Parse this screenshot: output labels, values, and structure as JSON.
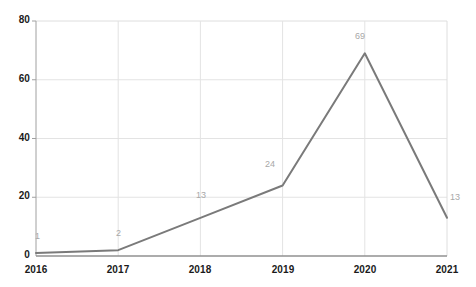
{
  "chart_data": {
    "type": "line",
    "title": "",
    "subtitle": "",
    "xlabel": "",
    "ylabel": "",
    "categories": [
      "2016",
      "2017",
      "2018",
      "2019",
      "2020",
      "2021"
    ],
    "values": [
      1,
      2,
      13,
      24,
      69,
      13
    ],
    "point_labels": [
      "1",
      "2",
      "13",
      "24",
      "69",
      "13"
    ],
    "series": [
      {
        "name": "",
        "values": [
          1,
          2,
          13,
          24,
          69,
          13
        ]
      }
    ],
    "ylim": [
      0,
      80
    ],
    "yticks": [
      0,
      20,
      40,
      60,
      80
    ],
    "ytick_labels": [
      "0",
      "20",
      "40",
      "60",
      "80"
    ],
    "xtick_labels": [
      "2016",
      "2017",
      "2018",
      "2019",
      "2020",
      "2021"
    ],
    "grid": true,
    "grid_axis": "both",
    "legend": false,
    "legend_position": "none",
    "line_color": "#7a7a7a",
    "grid_color": "#e0e0e0",
    "axis_color": "#9a9a9a",
    "label_color": "#1a1a1a",
    "point_label_color": "#a8a8a8",
    "background_color": "#ffffff"
  },
  "axes": {
    "y_labels": [
      {
        "text": "80",
        "value": 80
      },
      {
        "text": "60",
        "value": 60
      },
      {
        "text": "40",
        "value": 40
      },
      {
        "text": "20",
        "value": 20
      },
      {
        "text": "0",
        "value": 0
      }
    ],
    "x_labels": [
      {
        "text": "2016",
        "value": 2016
      },
      {
        "text": "2017",
        "value": 2017
      },
      {
        "text": "2018",
        "value": 2018
      },
      {
        "text": "2019",
        "value": 2019
      },
      {
        "text": "2020",
        "value": 2020
      },
      {
        "text": "2021",
        "value": 2021
      }
    ]
  },
  "data_labels": [
    {
      "text": "1"
    },
    {
      "text": "2"
    },
    {
      "text": "13"
    },
    {
      "text": "24"
    },
    {
      "text": "69"
    },
    {
      "text": "13"
    }
  ]
}
